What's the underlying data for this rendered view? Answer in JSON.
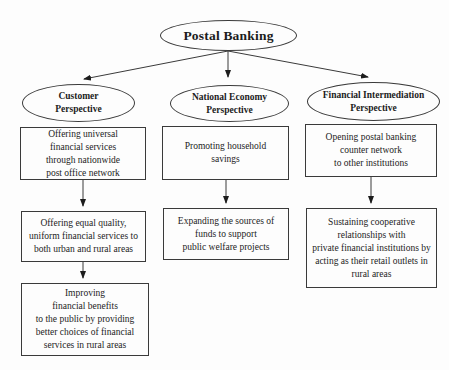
{
  "root": {
    "label": "Postal Banking"
  },
  "branches": [
    {
      "perspective": "Customer\nPerspective",
      "boxes": [
        "Offering universal\nfinancial services\nthrough nationwide\npost office network",
        "Offering equal quality,\nuniform financial services to\nboth urban and rural areas",
        "Improving\nfinancial benefits\nto the public by providing\nbetter choices of financial\nservices in rural areas"
      ]
    },
    {
      "perspective": "National Economy\nPerspective",
      "boxes": [
        "Promoting household\nsavings",
        "Expanding the sources of\nfunds to support\npublic welfare projects"
      ]
    },
    {
      "perspective": "Financial Intermediation\nPerspective",
      "boxes": [
        "Opening postal banking\ncounter network\nto other institutions",
        "Sustaining cooperative\nrelationships with\nprivate financial institutions by\nacting as their retail outlets in\nrural areas"
      ]
    }
  ],
  "colors": {
    "line": "#3a3a3a",
    "text": "#1c1c1c",
    "background": "#fdfdfd"
  }
}
